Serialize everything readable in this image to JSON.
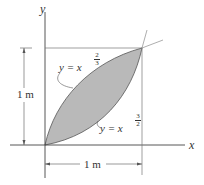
{
  "figure": {
    "x_axis_label": "x",
    "y_axis_label": "y",
    "width_dim": "1 m",
    "height_dim": "1 m",
    "curve_upper": {
      "lhs": "y = x",
      "exp_num": "2",
      "exp_den": "3"
    },
    "curve_lower": {
      "lhs": "y = x",
      "exp_num": "3",
      "exp_den": "2"
    },
    "colors": {
      "fill": "#b8b8b8",
      "line": "#444444"
    }
  }
}
